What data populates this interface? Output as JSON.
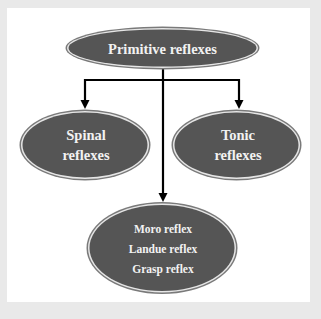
{
  "diagram": {
    "type": "hierarchy",
    "colors": {
      "background": "#e9e9e9",
      "panel": "#ffffff",
      "node_fill": "#555555",
      "node_inner_ring": "#e6e6e6",
      "node_outer_stroke": "#7a7a7a",
      "node_text": "#f2f2f2",
      "connector": "#000000"
    },
    "root": {
      "label": "Primitive reflexes"
    },
    "children": [
      {
        "id": "spinal",
        "lines": [
          "Spinal",
          "reflexes"
        ]
      },
      {
        "id": "tonic",
        "lines": [
          "Tonic",
          "reflexes"
        ]
      },
      {
        "id": "other",
        "lines": [
          "Moro reflex",
          "Landue reflex",
          "Grasp reflex"
        ]
      }
    ],
    "edges": [
      {
        "from": "Primitive reflexes",
        "to": "Spinal reflexes"
      },
      {
        "from": "Primitive reflexes",
        "to": "Tonic reflexes"
      },
      {
        "from": "Primitive reflexes",
        "to": "Moro reflex / Landue reflex / Grasp reflex"
      }
    ]
  }
}
